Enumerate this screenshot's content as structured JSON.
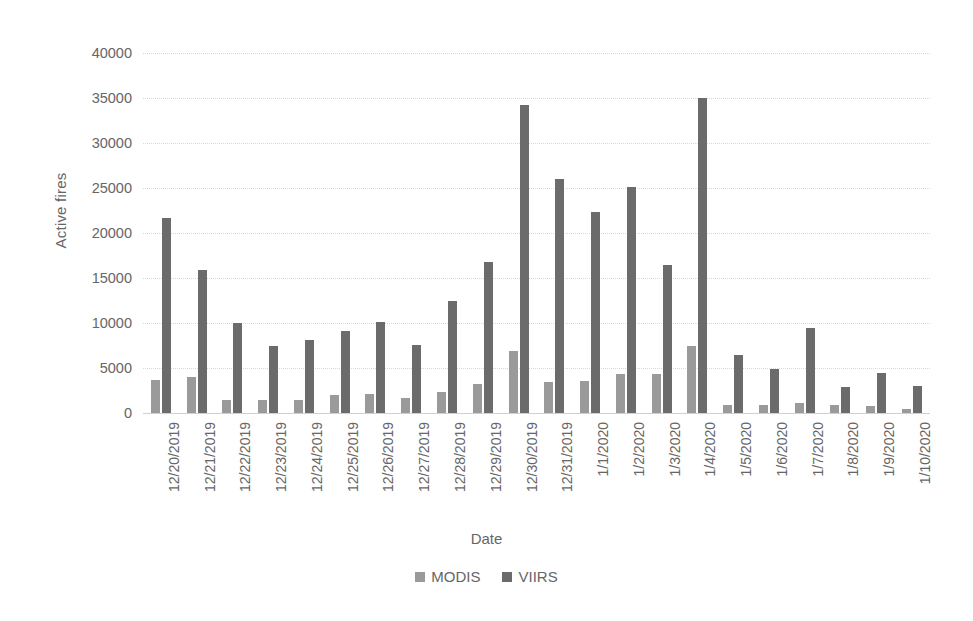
{
  "chart_data": {
    "type": "bar",
    "title": "",
    "xlabel": "Date",
    "ylabel": "Active fires",
    "ylim": [
      0,
      40000
    ],
    "ytick_step": 5000,
    "yticks": [
      0,
      5000,
      10000,
      15000,
      20000,
      25000,
      30000,
      35000,
      40000
    ],
    "ytick_labels": [
      "0",
      "5000",
      "10000",
      "15000",
      "20000",
      "25000",
      "30000",
      "35000",
      "40000"
    ],
    "grid": "horizontal-dotted",
    "legend_position": "bottom-center",
    "categories": [
      "12/20/2019",
      "12/21/2019",
      "12/22/2019",
      "12/23/2019",
      "12/24/2019",
      "12/25/2019",
      "12/26/2019",
      "12/27/2019",
      "12/28/2019",
      "12/29/2019",
      "12/30/2019",
      "12/31/2019",
      "1/1/2020",
      "1/2/2020",
      "1/3/2020",
      "1/4/2020",
      "1/5/2020",
      "1/6/2020",
      "1/7/2020",
      "1/8/2020",
      "1/9/2020",
      "1/10/2020"
    ],
    "series": [
      {
        "name": "MODIS",
        "color": "#9a9a9a",
        "values": [
          3700,
          4000,
          1400,
          1400,
          1400,
          2000,
          2100,
          1700,
          2300,
          3200,
          6900,
          3400,
          3600,
          4300,
          4300,
          7400,
          900,
          900,
          1100,
          900,
          800,
          500
        ]
      },
      {
        "name": "VIIRS",
        "color": "#6b6b6b",
        "values": [
          21700,
          15900,
          10000,
          7400,
          8100,
          9100,
          10100,
          7600,
          12500,
          16800,
          34200,
          26000,
          22300,
          25100,
          16400,
          35000,
          6500,
          4900,
          9400,
          2900,
          4500,
          3000
        ]
      }
    ]
  },
  "legend": {
    "entries": [
      {
        "label": "MODIS"
      },
      {
        "label": "VIIRS"
      }
    ]
  }
}
